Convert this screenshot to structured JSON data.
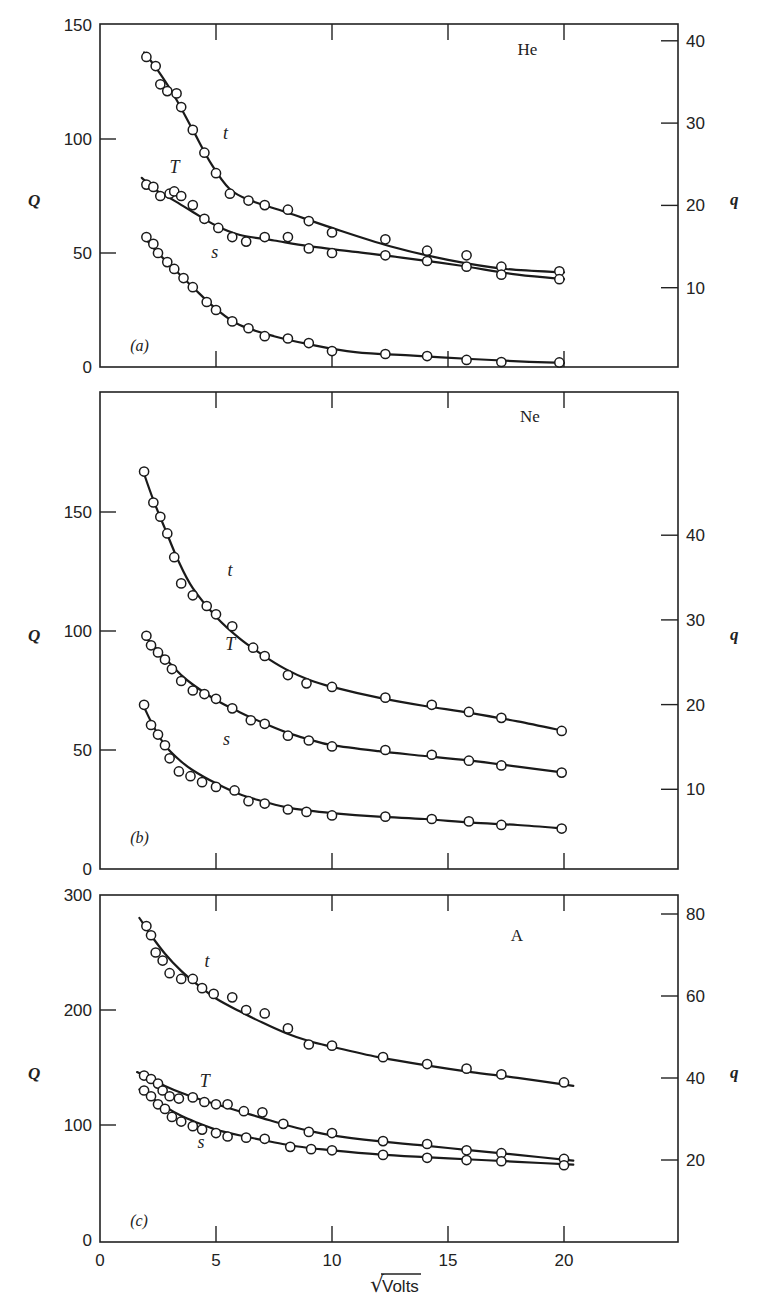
{
  "figure": {
    "xlabel": "Volts",
    "xlabel_sqrt_symbol": "√",
    "x_ticks": [
      "0",
      "5",
      "10",
      "15",
      "20"
    ]
  },
  "chart_data": [
    {
      "type": "scatter",
      "panel": "(a)",
      "title": "He",
      "xlabel": "√Volts",
      "ylabel": "Q",
      "ylabel_right": "q",
      "xlim": [
        0,
        25
      ],
      "ylim": [
        0,
        150
      ],
      "yticks": [
        0,
        50,
        100,
        150
      ],
      "yticks_right": [
        10,
        20,
        30,
        40
      ],
      "grid": false,
      "legend": "none; curves labeled inline t, T, s",
      "series": [
        {
          "name": "t",
          "x": [
            2.0,
            2.4,
            2.6,
            2.9,
            3.3,
            3.5,
            4.0,
            4.5,
            5.0,
            5.6,
            6.4,
            7.1,
            8.1,
            9.0,
            10.0,
            12.3,
            14.1,
            15.8,
            17.3,
            19.8
          ],
          "y": [
            136,
            132,
            124,
            121,
            120,
            114,
            104,
            94,
            85,
            76,
            73,
            71,
            69,
            64,
            59,
            56,
            51,
            49,
            44,
            42
          ]
        },
        {
          "name": "T",
          "x": [
            2.0,
            2.3,
            2.6,
            3.0,
            3.2,
            3.5,
            4.0,
            4.5,
            5.1,
            5.7,
            6.3,
            7.1,
            8.1,
            9.0,
            10.0,
            12.3,
            14.1,
            15.8,
            17.3,
            19.8
          ],
          "y": [
            80,
            79,
            75,
            76,
            77,
            75,
            71,
            65,
            61,
            57,
            55,
            57,
            57,
            52,
            50,
            49,
            46.5,
            44,
            40.5,
            38.5
          ]
        },
        {
          "name": "s",
          "x": [
            2.0,
            2.3,
            2.5,
            2.9,
            3.2,
            3.6,
            4.0,
            4.6,
            5.0,
            5.7,
            6.4,
            7.1,
            8.1,
            9.0,
            10.0,
            12.3,
            14.1,
            15.8,
            17.3,
            19.8
          ],
          "y": [
            57,
            54,
            50,
            46,
            43,
            39,
            35,
            28.5,
            25,
            20,
            17,
            13.5,
            12.5,
            10.5,
            7,
            5.7,
            4.8,
            3.1,
            2.2,
            2
          ]
        }
      ],
      "fit_curves": {
        "t": {
          "x": [
            1.9,
            2.5,
            3.2,
            4.0,
            4.8,
            5.6,
            6.5,
            8.0,
            10.0,
            12.5,
            15.0,
            17.5,
            20.0
          ],
          "y": [
            138,
            130,
            119,
            104,
            89,
            78,
            73,
            68,
            61,
            53,
            47,
            43,
            41.5
          ]
        },
        "T": {
          "x": [
            1.8,
            2.5,
            3.2,
            4.0,
            5.0,
            6.0,
            7.5,
            9.0,
            11.0,
            13.0,
            15.5,
            18.0,
            20.0
          ],
          "y": [
            83,
            77,
            73,
            68,
            62,
            58,
            55.5,
            53,
            50.5,
            48,
            44.5,
            40.5,
            38.5
          ]
        },
        "s": {
          "x": [
            1.9,
            2.5,
            3.2,
            4.0,
            5.0,
            6.0,
            7.5,
            9.0,
            11.0,
            13.5,
            16.0,
            18.5,
            20.0
          ],
          "y": [
            57,
            50,
            43,
            35,
            25.5,
            18.5,
            13.5,
            10,
            6.5,
            5,
            3.5,
            2.3,
            1.8
          ]
        }
      },
      "annotations": [
        {
          "text": "t",
          "x": 5.3,
          "y": 100
        },
        {
          "text": "T",
          "x": 3.0,
          "y": 85
        },
        {
          "text": "s",
          "x": 4.8,
          "y": 48
        },
        {
          "text": "He",
          "x": 18.0,
          "y": 137
        },
        {
          "text": "(a)",
          "x": 1.3,
          "y": 7
        }
      ]
    },
    {
      "type": "scatter",
      "panel": "(b)",
      "title": "Ne",
      "xlabel": "√Volts",
      "ylabel": "Q",
      "ylabel_right": "q",
      "xlim": [
        0,
        25
      ],
      "ylim": [
        0,
        200
      ],
      "yticks": [
        0,
        50,
        100,
        150
      ],
      "yticks_right": [
        10,
        20,
        30,
        40
      ],
      "grid": false,
      "series": [
        {
          "name": "t",
          "x": [
            1.9,
            2.3,
            2.6,
            2.9,
            3.2,
            3.5,
            4.0,
            4.6,
            5.0,
            5.7,
            6.6,
            7.1,
            8.1,
            8.9,
            10.0,
            12.3,
            14.3,
            15.9,
            17.3,
            19.9
          ],
          "y": [
            167,
            154,
            148,
            141,
            131,
            120,
            115,
            110.5,
            107,
            102,
            93,
            89.5,
            81.5,
            78,
            76.5,
            72,
            69,
            66,
            63.5,
            58
          ]
        },
        {
          "name": "T",
          "x": [
            2.0,
            2.2,
            2.5,
            2.8,
            3.1,
            3.5,
            4.0,
            4.5,
            5.0,
            5.7,
            6.5,
            7.1,
            8.1,
            9.0,
            10.0,
            12.3,
            14.3,
            15.9,
            17.3,
            19.9
          ],
          "y": [
            98,
            94,
            91,
            88,
            84,
            79,
            75,
            73.5,
            71.5,
            67.5,
            62.5,
            61,
            56,
            54,
            51.5,
            50,
            48,
            45.5,
            43.5,
            40.5
          ]
        },
        {
          "name": "s",
          "x": [
            1.9,
            2.2,
            2.5,
            2.8,
            3.0,
            3.4,
            3.9,
            4.4,
            5.0,
            5.8,
            6.4,
            7.1,
            8.1,
            8.9,
            10.0,
            12.3,
            14.3,
            15.9,
            17.3,
            19.9
          ],
          "y": [
            69,
            60.5,
            56.5,
            52,
            46.5,
            41,
            39,
            36.5,
            34.5,
            33,
            28.5,
            27.5,
            25,
            24,
            22.5,
            22,
            21,
            20,
            18.5,
            17
          ]
        }
      ],
      "fit_curves": {
        "t": {
          "x": [
            1.9,
            2.3,
            2.8,
            3.4,
            4.0,
            5.0,
            6.0,
            7.0,
            8.0,
            9.0,
            10.0,
            12.0,
            14.0,
            16.0,
            18.0,
            20.0
          ],
          "y": [
            166,
            155,
            143,
            129,
            118,
            106,
            97,
            90,
            84,
            79.5,
            76.5,
            72,
            68.5,
            65.5,
            62,
            58
          ]
        },
        "T": {
          "x": [
            2.0,
            2.5,
            3.0,
            3.5,
            4.0,
            5.0,
            6.0,
            7.0,
            8.0,
            9.0,
            10.0,
            12.0,
            14.0,
            16.0,
            18.0,
            20.0
          ],
          "y": [
            97,
            92,
            86.5,
            81.5,
            77.5,
            71,
            66,
            61.5,
            57.5,
            54.5,
            52,
            49.5,
            47.5,
            45.5,
            43,
            40.5
          ]
        },
        "s": {
          "x": [
            1.9,
            2.3,
            2.8,
            3.4,
            4.0,
            5.0,
            6.0,
            7.0,
            8.0,
            9.0,
            10.0,
            12.0,
            14.0,
            16.0,
            18.0,
            20.0
          ],
          "y": [
            68,
            60,
            52,
            46,
            41.5,
            36,
            31.5,
            28.5,
            26,
            24.5,
            23.5,
            22,
            21,
            19.5,
            18.5,
            17
          ]
        }
      },
      "annotations": [
        {
          "text": "t",
          "x": 5.5,
          "y": 123
        },
        {
          "text": "T",
          "x": 5.4,
          "y": 92
        },
        {
          "text": "s",
          "x": 5.3,
          "y": 52
        },
        {
          "text": "Ne",
          "x": 18.1,
          "y": 188
        },
        {
          "text": "(b)",
          "x": 1.3,
          "y": 11
        }
      ]
    },
    {
      "type": "scatter",
      "panel": "(c)",
      "title": "A",
      "xlabel": "√Volts",
      "ylabel": "Q",
      "ylabel_right": "q",
      "xlim": [
        0,
        25
      ],
      "ylim": [
        0,
        300
      ],
      "xticks": [
        0,
        5,
        10,
        15,
        20
      ],
      "yticks": [
        0,
        100,
        200,
        300
      ],
      "yticks_right": [
        20,
        40,
        60,
        80
      ],
      "grid": false,
      "series": [
        {
          "name": "t",
          "x": [
            2.0,
            2.2,
            2.4,
            2.7,
            3.0,
            3.5,
            4.0,
            4.4,
            4.9,
            5.7,
            6.3,
            7.1,
            8.1,
            9.0,
            10.0,
            12.2,
            14.1,
            15.8,
            17.3,
            20.0
          ],
          "y": [
            273,
            265,
            250,
            243,
            232,
            227,
            227,
            219,
            214,
            211,
            200,
            197,
            184,
            170,
            169,
            159,
            153,
            149,
            144,
            137
          ]
        },
        {
          "name": "T",
          "x": [
            1.9,
            2.2,
            2.5,
            2.7,
            3.0,
            3.4,
            4.0,
            4.5,
            5.0,
            5.5,
            6.2,
            7.0,
            7.9,
            9.0,
            10.0,
            12.2,
            14.1,
            15.8,
            17.3,
            20.0
          ],
          "y": [
            143,
            140,
            136,
            130,
            125,
            123,
            124,
            120,
            118,
            118,
            112,
            111,
            101,
            94,
            93,
            86,
            83.5,
            78,
            75.5,
            70.5
          ]
        },
        {
          "name": "s",
          "x": [
            1.9,
            2.2,
            2.5,
            2.8,
            3.1,
            3.5,
            4.0,
            4.4,
            5.0,
            5.5,
            6.3,
            7.1,
            8.2,
            9.1,
            10.0,
            12.2,
            14.1,
            15.8,
            17.3,
            20.0
          ],
          "y": [
            130,
            125,
            118,
            114,
            107,
            103,
            99,
            96,
            93,
            90,
            89,
            88,
            81,
            79,
            78,
            74,
            71.5,
            69.5,
            68.5,
            65
          ]
        }
      ],
      "fit_curves": {
        "t": {
          "x": [
            1.7,
            2.2,
            2.8,
            3.5,
            4.2,
            5.0,
            6.0,
            7.0,
            8.0,
            9.0,
            10.0,
            12.0,
            14.0,
            16.0,
            18.0,
            20.4
          ],
          "y": [
            280,
            265,
            249,
            234,
            222,
            210,
            199,
            189,
            180,
            173,
            168,
            159,
            152,
            146,
            141,
            134
          ]
        },
        "T": {
          "x": [
            1.6,
            2.2,
            2.8,
            3.5,
            4.2,
            5.0,
            6.0,
            7.0,
            8.0,
            9.0,
            10.0,
            12.0,
            14.0,
            16.0,
            18.0,
            20.4
          ],
          "y": [
            146,
            140,
            134,
            128,
            123,
            118,
            112,
            106,
            100,
            95,
            91,
            86,
            82,
            78,
            74,
            69
          ]
        },
        "s": {
          "x": [
            1.7,
            2.2,
            2.8,
            3.5,
            4.2,
            5.0,
            6.0,
            7.0,
            8.0,
            9.0,
            10.0,
            12.0,
            14.0,
            16.0,
            18.0,
            20.4
          ],
          "y": [
            131,
            124,
            116,
            108,
            102,
            96,
            91,
            87,
            83,
            80,
            78,
            74.5,
            72,
            70,
            68,
            65.5
          ]
        }
      },
      "annotations": [
        {
          "text": "t",
          "x": 4.5,
          "y": 237
        },
        {
          "text": "T",
          "x": 4.3,
          "y": 133
        },
        {
          "text": "s",
          "x": 4.2,
          "y": 80
        },
        {
          "text": "A",
          "x": 17.7,
          "y": 260
        },
        {
          "text": "(c)",
          "x": 1.3,
          "y": 12
        }
      ]
    }
  ],
  "panels_layout": [
    {
      "top": 24,
      "bottom": 367,
      "q_px_per_unit": 2.28,
      "q0_px": 367,
      "qr_px_per_unit": 8.23,
      "qr0_px": 370,
      "left_tick_labels": [
        "0",
        "50",
        "100",
        "150"
      ]
    },
    {
      "top": 392,
      "bottom": 869,
      "q_px_per_unit": 2.38,
      "q0_px": 869,
      "qr_px_per_unit": 8.47,
      "qr0_px": 874,
      "left_tick_labels": [
        "0",
        "50",
        "100",
        "150"
      ]
    },
    {
      "top": 895,
      "bottom": 1242,
      "q_px_per_unit": 1.15,
      "q0_px": 1240,
      "qr_px_per_unit": 4.1,
      "qr0_px": 1242,
      "left_tick_labels": [
        "0",
        "100",
        "200",
        "300"
      ]
    }
  ]
}
